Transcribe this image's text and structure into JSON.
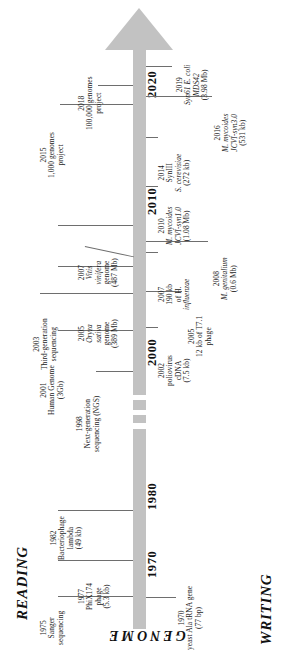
{
  "figure": {
    "type": "timeline",
    "title_axis_label": "GENOME",
    "left_side_label": "READING",
    "right_side_label": "WRITING",
    "axis_years": [
      "1970",
      "1980",
      "2000",
      "2010",
      "2020"
    ],
    "axis_note": "timeline bar runs bottom (1970) to top (2020) with a break between 1980s and 2000",
    "arrow_direction": "up"
  },
  "reading_events": [
    {
      "year": "1975",
      "l1": "Sanger",
      "l2": "sequencing",
      "l3": "",
      "l4": ""
    },
    {
      "year": "1982",
      "l1": "Bacteriophage",
      "l2": "lambda",
      "l3": "(49 kb)",
      "l4": ""
    },
    {
      "year": "1998",
      "l1": "Next-generation",
      "l2": "sequencing (NGS)",
      "l3": "",
      "l4": ""
    },
    {
      "year": "2001",
      "l1": "Human Genome",
      "l2": "(3Gb)",
      "l3": "",
      "l4": ""
    },
    {
      "year": "2003",
      "l1": "Third-generation",
      "l2": "sequencing",
      "l3": "",
      "l4": ""
    },
    {
      "year": "2005",
      "l1": "Oryza",
      "l2": "sativa",
      "l3": "genome",
      "l4": "(389 Mb)"
    },
    {
      "year": "2007",
      "l1": "Vitis",
      "l2": "vinifera",
      "l3": "genome",
      "l4": "(487 Mb)"
    },
    {
      "year": "2015",
      "l1": "1,000 genomes",
      "l2": "project",
      "l3": "",
      "l4": ""
    },
    {
      "year": "2018",
      "l1": "100,000 genomes",
      "l2": "project",
      "l3": "",
      "l4": ""
    }
  ],
  "writing_events": [
    {
      "year": "1970",
      "l1": "yeast Ala tRNA gene",
      "l2": "(77 bp)",
      "l3": "",
      "l4": ""
    },
    {
      "year": "1977",
      "l1": "PhiX174",
      "l2": "phage",
      "l3": "(5.3 kb)",
      "l4": ""
    },
    {
      "year": "2002",
      "l1": "poliovirus",
      "l2": "cDNA",
      "l3": "(7.5 kb)",
      "l4": ""
    },
    {
      "year": "2005",
      "l1": "12 kb of T7.1",
      "l2": "phage",
      "l3": "",
      "l4": ""
    },
    {
      "year": "2007",
      "l1": "190 kb",
      "l2": "of H.",
      "l3": "influenzae",
      "l4": ""
    },
    {
      "year": "2008",
      "l1": "M. genitalium",
      "l2": "(0.6 Mb)",
      "l3": "",
      "l4": ""
    },
    {
      "year": "2010",
      "l1": "M. mycoides",
      "l2": "JCVI-syn1.0",
      "l3": "(1.08 Mb)",
      "l4": ""
    },
    {
      "year": "2014",
      "l1": "SynIII",
      "l2": "S. cerevisiae",
      "l3": "(272 kb)",
      "l4": ""
    },
    {
      "year": "2016",
      "l1": "M. mycoides",
      "l2": "JCVI-syn3.0",
      "l3": "(531 kb)",
      "l4": ""
    },
    {
      "year": "2019",
      "l1": "Syn61 E. coli",
      "l2": "MDS42",
      "l3": "(3.98 Mb)",
      "l4": ""
    }
  ],
  "colors": {
    "bar": "#c2c2c2",
    "tick": "#6e6e6e",
    "text": "#1a1a1a",
    "background": "#ffffff"
  }
}
